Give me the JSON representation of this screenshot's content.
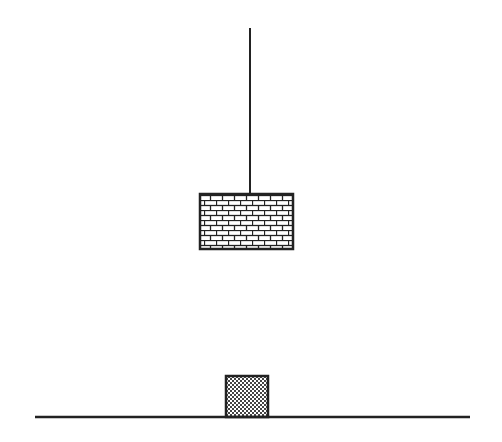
{
  "diagram": {
    "type": "physics-illustration",
    "colors": {
      "stroke": "#222222",
      "background": "#ffffff",
      "fill_light": "#ffffff",
      "checker_dark": "#444444"
    },
    "rope": {
      "x": 250,
      "y1": 28,
      "y2": 194
    },
    "hanging_block": {
      "pattern": "brick",
      "x": 200,
      "y": 194,
      "width": 93,
      "height": 55
    },
    "ground_block": {
      "pattern": "checker",
      "x": 226,
      "y": 376,
      "width": 42,
      "height": 41
    },
    "ground": {
      "x1": 35,
      "x2": 470,
      "y": 417
    }
  }
}
